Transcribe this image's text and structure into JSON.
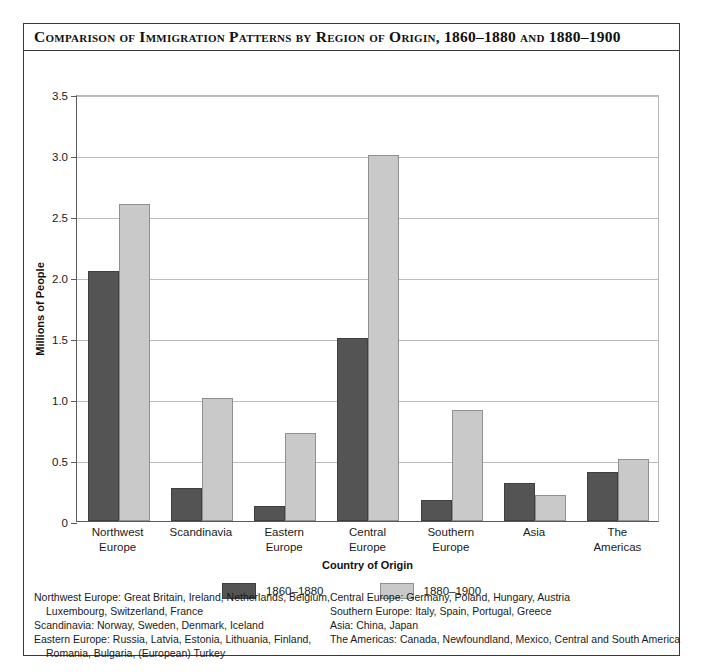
{
  "figure": {
    "title": "Comparison of Immigration Patterns by Region of Origin, 1860–1880 and 1880–1900"
  },
  "axes": {
    "y_title": "Millions of People",
    "x_title": "Country of Origin",
    "y_ticks": [
      "3.5",
      "3.0",
      "2.5",
      "2.0",
      "1.5",
      "1.0",
      "0.5",
      "0"
    ]
  },
  "legend": {
    "items": [
      {
        "label": "1860–1880",
        "color": "#545454"
      },
      {
        "label": "1880–1900",
        "color": "#c9c9c9"
      }
    ]
  },
  "footnotes": {
    "left": [
      {
        "text": "Northwest Europe: Great Britain, Ireland, Netherlands, Belgium,",
        "indent": false
      },
      {
        "text": "Luxembourg, Switzerland, France",
        "indent": true
      },
      {
        "text": "Scandinavia: Norway, Sweden, Denmark, Iceland",
        "indent": false
      },
      {
        "text": "Eastern Europe: Russia, Latvia, Estonia, Lithuania, Finland,",
        "indent": false
      },
      {
        "text": "Romania, Bulgaria, (European) Turkey",
        "indent": true
      }
    ],
    "right": [
      {
        "text": "Central Europe: Germany, Poland, Hungary, Austria",
        "indent": false
      },
      {
        "text": "Southern Europe: Italy, Spain, Portugal, Greece",
        "indent": false
      },
      {
        "text": "Asia: China, Japan",
        "indent": false
      },
      {
        "text": "The Americas: Canada, Newfoundland, Mexico, Central and South America",
        "indent": false
      }
    ]
  },
  "chart_data": {
    "type": "bar",
    "title": "Comparison of Immigration Patterns by Region of Origin, 1860–1880 and 1880–1900",
    "xlabel": "Country of Origin",
    "ylabel": "Millions of People",
    "ylim": [
      0,
      3.5
    ],
    "yticks": [
      0,
      0.5,
      1.0,
      1.5,
      2.0,
      2.5,
      3.0,
      3.5
    ],
    "grid": true,
    "legend_position": "bottom",
    "categories": [
      "Northwest Europe",
      "Scandinavia",
      "Eastern Europe",
      "Central Europe",
      "Southern Europe",
      "Asia",
      "The Americas"
    ],
    "category_lines": [
      [
        "Northwest",
        "Europe"
      ],
      [
        "Scandinavia"
      ],
      [
        "Eastern",
        "Europe"
      ],
      [
        "Central",
        "Europe"
      ],
      [
        "Southern",
        "Europe"
      ],
      [
        "Asia"
      ],
      [
        "The",
        "Americas"
      ]
    ],
    "series": [
      {
        "name": "1860–1880",
        "color": "#545454",
        "values": [
          2.05,
          0.27,
          0.12,
          1.5,
          0.17,
          0.31,
          0.4
        ]
      },
      {
        "name": "1880–1900",
        "color": "#c9c9c9",
        "values": [
          2.6,
          1.01,
          0.72,
          3.0,
          0.91,
          0.21,
          0.51
        ]
      }
    ]
  }
}
